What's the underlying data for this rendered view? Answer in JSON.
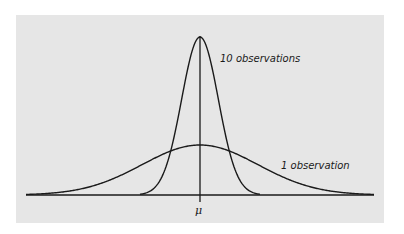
{
  "chart_data": {
    "type": "line",
    "title": "",
    "xlabel": "",
    "ylabel": "",
    "x_tick_labels": [
      "μ"
    ],
    "grid": false,
    "legend": "none (inline curve labels)",
    "series": [
      {
        "name": "10 observations",
        "distribution": "normal",
        "mean": 0,
        "sd": 0.316,
        "relative_peak_height": 3.16
      },
      {
        "name": "1 observation",
        "distribution": "normal",
        "mean": 0,
        "sd": 1,
        "relative_peak_height": 1
      }
    ],
    "annotations": [
      "10 observations",
      "1 observation",
      "μ"
    ],
    "x_range_sd": [
      -3,
      3
    ]
  },
  "labels": {
    "narrow": "10 observations",
    "wide": "1 observation",
    "mean": "μ"
  },
  "colors": {
    "background": "#e6e6e6",
    "line": "#1a1a1a"
  }
}
